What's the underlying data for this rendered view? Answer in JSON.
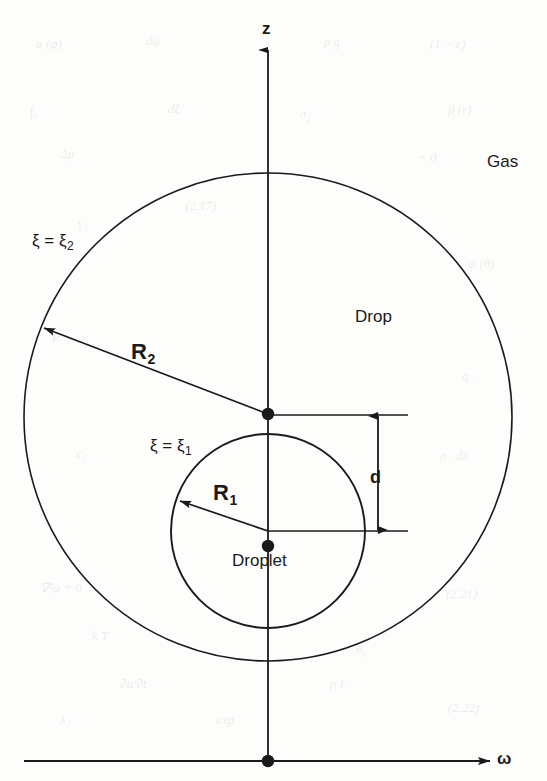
{
  "figure": {
    "caption_present": false,
    "background_color": "#fdfdfc",
    "ink_color": "#1a1a1a"
  },
  "axes": {
    "vertical": {
      "label": "z",
      "label_x": 262,
      "label_y": 20,
      "x": 268,
      "y_top": 50,
      "y_bottom": 761,
      "arrow": "up"
    },
    "horizontal": {
      "label": "ω",
      "label_x": 497,
      "label_y": 750,
      "y": 761,
      "x_left": 24,
      "x_right": 490,
      "arrow": "right"
    },
    "origin": {
      "x": 268,
      "y": 761
    }
  },
  "regions": {
    "gas": {
      "label": "Gas",
      "x": 487,
      "y": 153
    },
    "drop": {
      "label": "Drop",
      "x": 355,
      "y": 308
    },
    "droplet": {
      "label": "Droplet",
      "x": 232,
      "y": 552
    }
  },
  "circles": {
    "outer": {
      "name": "drop-boundary",
      "center_x": 268,
      "center_y": 417,
      "radius": 244,
      "surface_label": "ξ = ξ",
      "surface_label_sub": "2",
      "surface_label_x": 32,
      "surface_label_y": 232,
      "center_dot_x": 268,
      "center_dot_y": 414
    },
    "inner": {
      "name": "droplet-boundary",
      "center_x": 268,
      "center_y": 531,
      "radius": 97,
      "surface_label": "ξ = ξ",
      "surface_label_sub": "1",
      "surface_label_x": 150,
      "surface_label_y": 437,
      "center_dot_x": 268,
      "center_dot_y": 546
    }
  },
  "radii": {
    "outer": {
      "label": "R",
      "label_sub": "2",
      "label_x": 131,
      "label_y": 341,
      "from_x": 268,
      "from_y": 414,
      "to_x": 44,
      "to_y": 328
    },
    "inner": {
      "label": "R",
      "label_sub": "1",
      "label_x": 213,
      "label_y": 482,
      "from_x": 268,
      "from_y": 531,
      "to_x": 180,
      "to_y": 501
    }
  },
  "dimension": {
    "label": "d",
    "label_x": 370,
    "label_y": 468,
    "x": 378,
    "y_top": 416,
    "y_bottom": 530,
    "leader_top_y": 415,
    "leader_bottom_y": 531,
    "leader_x_start": 268,
    "leader_x_end": 408
  },
  "ghost_text": [
    {
      "t": "α (φ)",
      "x": 36,
      "y": 36
    },
    {
      "t": "dφ",
      "x": 146,
      "y": 33
    },
    {
      "t": "ρ g",
      "x": 324,
      "y": 34
    },
    {
      "t": "(1 − ε)",
      "x": 430,
      "y": 36
    },
    {
      "t": "∫₀",
      "x": 30,
      "y": 104
    },
    {
      "t": "dξ",
      "x": 168,
      "y": 101
    },
    {
      "t": "σ₂",
      "x": 300,
      "y": 106
    },
    {
      "t": "β (r)",
      "x": 448,
      "y": 102
    },
    {
      "t": "Δμ",
      "x": 60,
      "y": 146
    },
    {
      "t": "(2.17)",
      "x": 185,
      "y": 198
    },
    {
      "t": "= 0",
      "x": 418,
      "y": 150
    },
    {
      "t": "γ₁",
      "x": 78,
      "y": 216
    },
    {
      "t": "ψ (θ)",
      "x": 468,
      "y": 256
    },
    {
      "t": "R → ∞",
      "x": 52,
      "y": 330
    },
    {
      "t": "q₂",
      "x": 462,
      "y": 368
    },
    {
      "t": "c₁",
      "x": 76,
      "y": 446
    },
    {
      "t": "n · ds",
      "x": 440,
      "y": 448
    },
    {
      "t": "∇²φ = 0",
      "x": 40,
      "y": 580
    },
    {
      "t": "(2.21)",
      "x": 446,
      "y": 586
    },
    {
      "t": "k T",
      "x": 92,
      "y": 628
    },
    {
      "t": "θ₀",
      "x": 356,
      "y": 642
    },
    {
      "t": "∂u/∂t",
      "x": 120,
      "y": 676
    },
    {
      "t": "ρ ℓ",
      "x": 330,
      "y": 676
    },
    {
      "t": "(2.22)",
      "x": 448,
      "y": 700
    },
    {
      "t": "λ₂",
      "x": 60,
      "y": 712
    },
    {
      "t": "exp",
      "x": 216,
      "y": 712
    }
  ]
}
